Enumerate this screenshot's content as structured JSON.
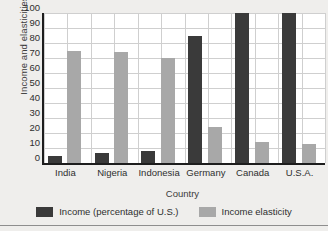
{
  "chart_data": {
    "type": "bar",
    "title": "",
    "xlabel": "Country",
    "ylabel": "Income and elasticities",
    "categories": [
      "India",
      "Nigeria",
      "Indonesia",
      "Germany",
      "Canada",
      "U.S.A."
    ],
    "series": [
      {
        "name": "Income (percentage of U.S.)",
        "color": "#3a3a3a",
        "values": [
          5,
          7,
          8,
          85,
          100,
          100
        ]
      },
      {
        "name": "Income elasticity",
        "color": "#a8a8a8",
        "values": [
          75,
          74,
          70,
          24,
          14,
          13
        ]
      }
    ],
    "ylim": [
      0,
      100
    ],
    "yticks": [
      100,
      90,
      80,
      70,
      60,
      50,
      40,
      30,
      20,
      10,
      0
    ],
    "grid": true,
    "legend_position": "bottom"
  },
  "colors": {
    "page_background": "#efeeec",
    "plot_background": "#ffffff",
    "axis": "#1d1d1d",
    "gridline": "#cfcfcf",
    "series_dark": "#3a3a3a",
    "series_light": "#a8a8a8"
  }
}
